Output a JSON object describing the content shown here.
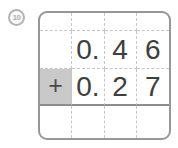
{
  "problem": {
    "number": "10",
    "operator": "+"
  },
  "grid": {
    "rows": [
      {
        "cells": [
          "",
          "",
          "",
          ""
        ]
      },
      {
        "cells": [
          "",
          "0.",
          "4",
          "6"
        ]
      },
      {
        "cells": [
          "+",
          "0.",
          "2",
          "7"
        ]
      },
      {
        "cells": [
          "",
          "",
          "",
          ""
        ]
      }
    ]
  },
  "colors": {
    "background": "#ffffff",
    "box_border": "#979797",
    "dashed_grid_line": "#c6c6c6",
    "sum_line": "#8d8d8d",
    "operator_cell_bg": "#c9c9c9",
    "digit_text": "#3e3e3e",
    "badge_gray": "#b4b4b4"
  }
}
